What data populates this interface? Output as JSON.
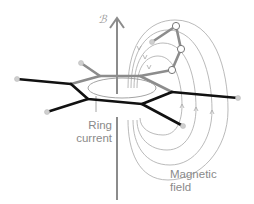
{
  "diagram": {
    "field_symbol": "ℬ",
    "ring_current_label_line1": "Ring",
    "ring_current_label_line2": "current",
    "magnetic_field_label_line1": "Magnetic",
    "magnetic_field_label_line2": "field",
    "colors": {
      "front_bonds": "#111111",
      "back_bonds": "#8c8c8c",
      "field_lines": "#a0a0a0",
      "labels": "#8a8a8a",
      "atoms": "#c8c8c8"
    }
  }
}
